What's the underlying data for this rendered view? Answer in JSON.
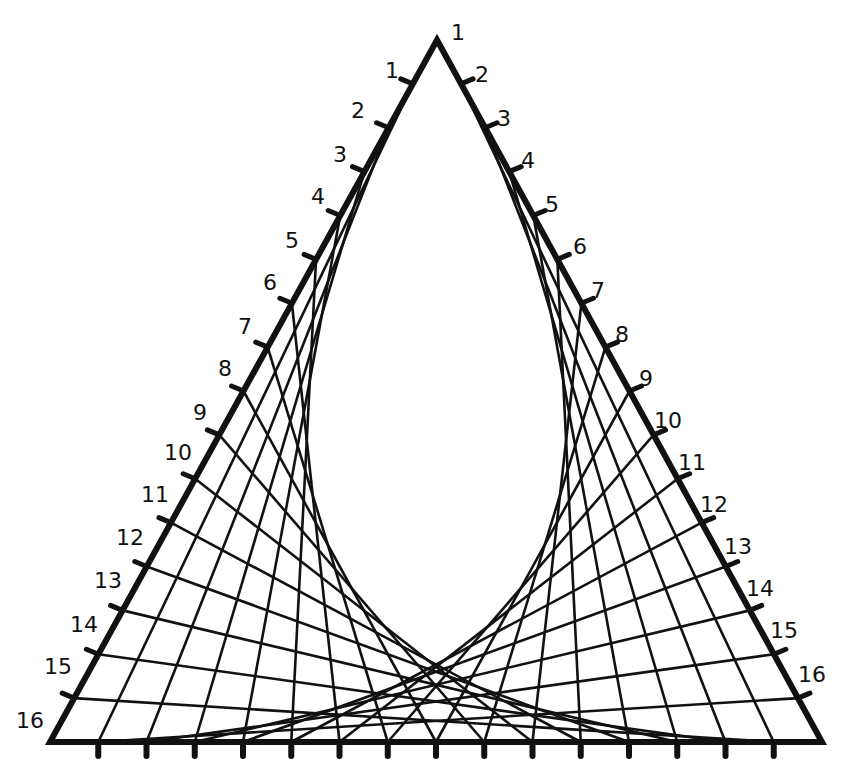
{
  "diagram": {
    "type": "string-art-triangle",
    "colors": {
      "ink": "#111111",
      "background": "#ffffff"
    },
    "triangle": {
      "apex": [
        437,
        40
      ],
      "bottom_left": [
        50,
        742
      ],
      "bottom_right": [
        822,
        742
      ]
    },
    "divisions": 16,
    "bottom_ticks": 15,
    "left_labels": [
      "1",
      "2",
      "3",
      "4",
      "5",
      "6",
      "7",
      "8",
      "9",
      "10",
      "11",
      "12",
      "13",
      "14",
      "15",
      "16"
    ],
    "right_labels": [
      "1",
      "2",
      "3",
      "4",
      "5",
      "6",
      "7",
      "8",
      "9",
      "10",
      "11",
      "12",
      "13",
      "14",
      "15",
      "16"
    ],
    "left_label_positions": [
      [
        392,
        78
      ],
      [
        358,
        118
      ],
      [
        340,
        162
      ],
      [
        318,
        204
      ],
      [
        292,
        248
      ],
      [
        270,
        290
      ],
      [
        245,
        334
      ],
      [
        225,
        376
      ],
      [
        200,
        420
      ],
      [
        178,
        460
      ],
      [
        155,
        502
      ],
      [
        130,
        545
      ],
      [
        108,
        588
      ],
      [
        84,
        632
      ],
      [
        58,
        674
      ],
      [
        30,
        728
      ]
    ],
    "right_label_positions": [
      [
        458,
        40
      ],
      [
        482,
        82
      ],
      [
        504,
        126
      ],
      [
        528,
        168
      ],
      [
        552,
        212
      ],
      [
        580,
        254
      ],
      [
        598,
        298
      ],
      [
        622,
        342
      ],
      [
        646,
        386
      ],
      [
        668,
        428
      ],
      [
        692,
        470
      ],
      [
        714,
        512
      ],
      [
        738,
        554
      ],
      [
        760,
        596
      ],
      [
        784,
        638
      ],
      [
        812,
        682
      ]
    ]
  }
}
